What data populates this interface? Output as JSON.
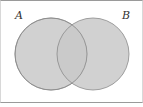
{
  "diagram": {
    "type": "venn",
    "sets": [
      {
        "label": "A",
        "cx": 51,
        "cy": 54,
        "r": 36
      },
      {
        "label": "B",
        "cx": 93,
        "cy": 54,
        "r": 36
      }
    ],
    "fill_color": "#c9c9c9",
    "stroke_color": "#8a8a8a"
  }
}
